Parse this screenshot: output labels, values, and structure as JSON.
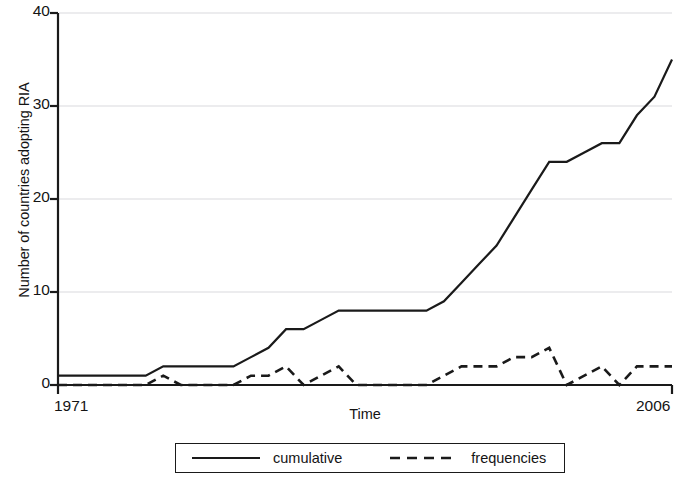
{
  "chart_data": {
    "type": "line",
    "title": "",
    "xlabel": "Time",
    "ylabel": "Number of countries adopting RIA",
    "xlim": [
      1971,
      2006
    ],
    "ylim": [
      0,
      40
    ],
    "yticks": [
      0,
      10,
      20,
      30,
      40
    ],
    "ytick_labels": [
      "0",
      "10",
      "20",
      "30",
      "40"
    ],
    "xticks": [
      1971,
      2006
    ],
    "xtick_labels": [
      "1971",
      "2006"
    ],
    "grid": "horizontal-faint",
    "legend_position": "below-center",
    "x": [
      1971,
      1972,
      1973,
      1974,
      1975,
      1976,
      1977,
      1978,
      1979,
      1980,
      1981,
      1982,
      1983,
      1984,
      1985,
      1986,
      1987,
      1988,
      1989,
      1990,
      1991,
      1992,
      1993,
      1994,
      1995,
      1996,
      1997,
      1998,
      1999,
      2000,
      2001,
      2002,
      2003,
      2004,
      2005,
      2006
    ],
    "series": [
      {
        "name": "cumulative",
        "style": "solid",
        "color": "#1a1a1a",
        "values": [
          1,
          1,
          1,
          1,
          1,
          1,
          2,
          2,
          2,
          2,
          2,
          3,
          4,
          6,
          6,
          7,
          8,
          8,
          8,
          8,
          8,
          8,
          9,
          11,
          13,
          15,
          18,
          21,
          24,
          24,
          25,
          26,
          26,
          29,
          31,
          35
        ]
      },
      {
        "name": "frequencies",
        "style": "dashed",
        "color": "#1a1a1a",
        "values": [
          0,
          0,
          0,
          0,
          0,
          0,
          1,
          0,
          0,
          0,
          0,
          1,
          1,
          2,
          0,
          1,
          2,
          0,
          0,
          0,
          0,
          0,
          1,
          2,
          2,
          2,
          3,
          3,
          4,
          0,
          1,
          2,
          0,
          2,
          2,
          2
        ]
      }
    ]
  },
  "legend": {
    "items": [
      {
        "label": "cumulative",
        "style": "solid"
      },
      {
        "label": "frequencies",
        "style": "dashed"
      }
    ]
  }
}
